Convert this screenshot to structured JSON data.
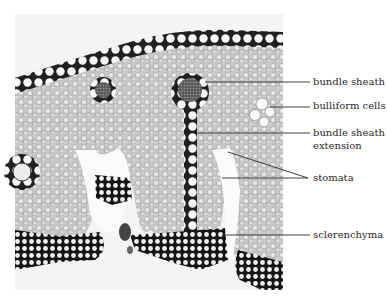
{
  "figure": {
    "colors": {
      "background": "#ffffff",
      "tissue_light": "#d9d9d9",
      "tissue_mid": "#a8a8a8",
      "cell_wall": "#1a1a1a",
      "leader_line": "#2a2a2a",
      "label_text": "#2a2a2a"
    }
  },
  "labels": [
    {
      "id": "bundle-sheath",
      "text": "bundle sheath",
      "line2": ""
    },
    {
      "id": "bulliform-cells",
      "text": "bulliform cells",
      "line2": ""
    },
    {
      "id": "bundle-sheath-extension",
      "text": "bundle sheath",
      "line2": "extension"
    },
    {
      "id": "stomata",
      "text": "stomata",
      "line2": ""
    },
    {
      "id": "sclerenchyma",
      "text": "sclerenchyma",
      "line2": ""
    }
  ]
}
